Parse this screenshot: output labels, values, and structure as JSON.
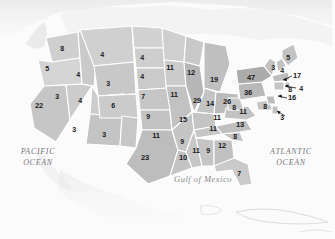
{
  "map": {
    "title": "United States electoral vote map",
    "projection": "contiguous united states",
    "colors": {
      "state_fill_light": "#d8d8d8",
      "state_fill_mid": "#c9c9c9",
      "state_fill_dark": "#bdbdbd",
      "border": "#ffffff",
      "background": "#fbfbfb",
      "label_text": "#1a1a1a",
      "water_text": "#6e6e6e"
    }
  },
  "water_labels": [
    {
      "id": "pacific",
      "line1": "PACIFIC",
      "line2": "OCEAN",
      "x": 38,
      "y": 158
    },
    {
      "id": "atlantic",
      "line1": "ATLANTIC",
      "line2": "OCEAN",
      "x": 291,
      "y": 158
    },
    {
      "id": "gulf",
      "line1": "Gulf of Mexico",
      "line2": "",
      "x": 203,
      "y": 180
    }
  ],
  "states": [
    {
      "code": "WA",
      "name": "Washington",
      "value": 8,
      "x": 62,
      "y": 48
    },
    {
      "code": "OR",
      "name": "Oregon",
      "value": 5,
      "x": 47,
      "y": 68
    },
    {
      "code": "CA",
      "name": "California",
      "value": 22,
      "x": 39,
      "y": 106
    },
    {
      "code": "NV",
      "name": "Nevada",
      "value": 3,
      "x": 57,
      "y": 96
    },
    {
      "code": "ID",
      "name": "Idaho",
      "value": 4,
      "x": 78,
      "y": 74
    },
    {
      "code": "MT",
      "name": "Montana",
      "value": 4,
      "x": 102,
      "y": 54
    },
    {
      "code": "WY",
      "name": "Wyoming",
      "value": 3,
      "x": 108,
      "y": 83
    },
    {
      "code": "UT",
      "name": "Utah",
      "value": 4,
      "x": 80,
      "y": 100
    },
    {
      "code": "AZ",
      "name": "Arizona",
      "value": 3,
      "x": 74,
      "y": 129
    },
    {
      "code": "CO",
      "name": "Colorado",
      "value": 6,
      "x": 113,
      "y": 105
    },
    {
      "code": "NM",
      "name": "New Mexico",
      "value": 3,
      "x": 104,
      "y": 134
    },
    {
      "code": "ND",
      "name": "North Dakota",
      "value": 4,
      "x": 142,
      "y": 57
    },
    {
      "code": "SD",
      "name": "South Dakota",
      "value": 4,
      "x": 142,
      "y": 76
    },
    {
      "code": "NE",
      "name": "Nebraska",
      "value": 7,
      "x": 143,
      "y": 96
    },
    {
      "code": "KS",
      "name": "Kansas",
      "value": 9,
      "x": 148,
      "y": 116
    },
    {
      "code": "OK",
      "name": "Oklahoma",
      "value": 11,
      "x": 156,
      "y": 136
    },
    {
      "code": "TX",
      "name": "Texas",
      "value": 23,
      "x": 145,
      "y": 158
    },
    {
      "code": "MN",
      "name": "Minnesota",
      "value": 11,
      "x": 170,
      "y": 68
    },
    {
      "code": "IA",
      "name": "Iowa",
      "value": 11,
      "x": 174,
      "y": 95
    },
    {
      "code": "MO",
      "name": "Missouri",
      "value": 15,
      "x": 183,
      "y": 120
    },
    {
      "code": "AR",
      "name": "Arkansas",
      "value": 9,
      "x": 182,
      "y": 141
    },
    {
      "code": "LA",
      "name": "Louisiana",
      "value": 10,
      "x": 183,
      "y": 158
    },
    {
      "code": "WI",
      "name": "Wisconsin",
      "value": 12,
      "x": 191,
      "y": 73
    },
    {
      "code": "IL",
      "name": "Illinois",
      "value": 29,
      "x": 197,
      "y": 101
    },
    {
      "code": "MI",
      "name": "Michigan",
      "value": 19,
      "x": 214,
      "y": 80
    },
    {
      "code": "IN",
      "name": "Indiana",
      "value": 14,
      "x": 210,
      "y": 104
    },
    {
      "code": "OH",
      "name": "Ohio",
      "value": 26,
      "x": 227,
      "y": 102
    },
    {
      "code": "MS",
      "name": "Mississippi",
      "value": 11,
      "x": 196,
      "y": 151
    },
    {
      "code": "AL",
      "name": "Alabama",
      "value": 9,
      "x": 208,
      "y": 150
    },
    {
      "code": "TN",
      "name": "Tennessee",
      "value": 11,
      "x": 213,
      "y": 129
    },
    {
      "code": "KY",
      "name": "Kentucky",
      "value": 11,
      "x": 217,
      "y": 118
    },
    {
      "code": "GA",
      "name": "Georgia",
      "value": 12,
      "x": 222,
      "y": 146
    },
    {
      "code": "FL",
      "name": "Florida",
      "value": 7,
      "x": 239,
      "y": 173
    },
    {
      "code": "SC",
      "name": "South Carolina",
      "value": 8,
      "x": 235,
      "y": 136
    },
    {
      "code": "NC",
      "name": "North Carolina",
      "value": 13,
      "x": 240,
      "y": 125
    },
    {
      "code": "VA",
      "name": "Virginia",
      "value": 11,
      "x": 243,
      "y": 112
    },
    {
      "code": "WV",
      "name": "West Virginia",
      "value": 8,
      "x": 234,
      "y": 107
    },
    {
      "code": "PA",
      "name": "Pennsylvania",
      "value": 36,
      "x": 248,
      "y": 93
    },
    {
      "code": "NY",
      "name": "New York",
      "value": 47,
      "x": 251,
      "y": 78
    },
    {
      "code": "VT",
      "name": "Vermont",
      "value": 3,
      "x": 273,
      "y": 67
    },
    {
      "code": "NH",
      "name": "New Hampshire",
      "value": 4,
      "x": 282,
      "y": 70
    },
    {
      "code": "ME",
      "name": "Maine",
      "value": 5,
      "x": 288,
      "y": 57
    },
    {
      "code": "MA",
      "name": "Massachusetts",
      "value": 17,
      "x": 297,
      "y": 76
    },
    {
      "code": "RI",
      "name": "Rhode Island",
      "value": 4,
      "x": 301,
      "y": 88
    },
    {
      "code": "CT",
      "name": "Connecticut",
      "value": 8,
      "x": 290,
      "y": 89
    },
    {
      "code": "NJ",
      "name": "New Jersey",
      "value": 16,
      "x": 292,
      "y": 98
    },
    {
      "code": "DE",
      "name": "Delaware",
      "value": 3,
      "x": 282,
      "y": 117
    },
    {
      "code": "MD",
      "name": "Maryland",
      "value": 8,
      "x": 265,
      "y": 106
    }
  ]
}
